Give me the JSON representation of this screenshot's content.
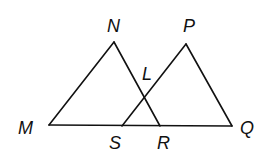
{
  "figure": {
    "type": "geometry",
    "stroke_color": "#111111",
    "background": "#ffffff",
    "points": {
      "M": {
        "label": "M",
        "x": 49,
        "y": 125
      },
      "N": {
        "label": "N",
        "x": 114,
        "y": 42
      },
      "P": {
        "label": "P",
        "x": 186,
        "y": 44
      },
      "L": {
        "label": "L",
        "x": 144,
        "y": 97
      },
      "S": {
        "label": "S",
        "x": 122,
        "y": 126
      },
      "R": {
        "label": "R",
        "x": 160,
        "y": 126
      },
      "Q": {
        "label": "Q",
        "x": 232,
        "y": 126
      }
    },
    "segments": [
      {
        "name": "MN",
        "from": "M",
        "to": "N"
      },
      {
        "name": "NR",
        "from": "N",
        "to": "R"
      },
      {
        "name": "MQ",
        "from": "M",
        "to": "Q"
      },
      {
        "name": "SP",
        "from": "S",
        "to": "P"
      },
      {
        "name": "PQ",
        "from": "P",
        "to": "Q"
      }
    ],
    "labels": {
      "M": "M",
      "N": "N",
      "P": "P",
      "L": "L",
      "S": "S",
      "R": "R",
      "Q": "Q"
    }
  }
}
